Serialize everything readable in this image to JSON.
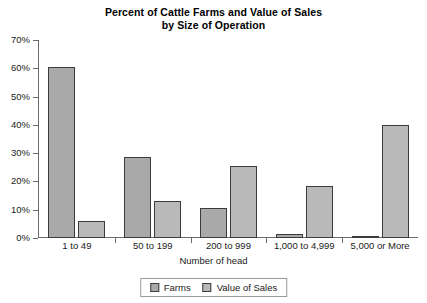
{
  "chart_data": {
    "type": "bar",
    "title": "Percent of Cattle Farms and Value of Sales by Size of Operation",
    "title_line1": "Percent of Cattle Farms and Value of Sales",
    "title_line2": "by Size of Operation",
    "xlabel": "Number of head",
    "ylabel": "",
    "ylim": [
      0,
      70
    ],
    "ytick_labels": [
      "0%",
      "10%",
      "20%",
      "30%",
      "40%",
      "50%",
      "60%",
      "70%"
    ],
    "ytick_values": [
      0,
      10,
      20,
      30,
      40,
      50,
      60,
      70
    ],
    "grid": false,
    "legend_position": "bottom",
    "categories": [
      "1 to 49",
      "50 to 199",
      "200 to 999",
      "1,000 to 4,999",
      "5,000 or More"
    ],
    "series": [
      {
        "name": "Farms",
        "color": "#a9a9a9",
        "values": [
          60.5,
          28.5,
          10.5,
          1.5,
          0.3
        ]
      },
      {
        "name": "Value of Sales",
        "color": "#b9b9b9",
        "values": [
          6.0,
          13.0,
          25.5,
          18.5,
          40.0
        ]
      }
    ]
  },
  "legend": {
    "items": [
      {
        "label": "Farms"
      },
      {
        "label": "Value of Sales"
      }
    ]
  }
}
